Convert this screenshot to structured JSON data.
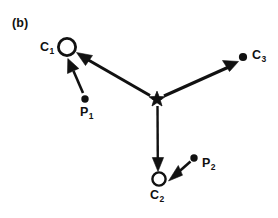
{
  "figure": {
    "panel_label": "(b)",
    "background_color": "#ffffff",
    "stroke_color": "#111111",
    "width": 278,
    "height": 218
  },
  "nodes": {
    "c1": {
      "label_main": "C",
      "label_sub": "1",
      "marker": "open-circle",
      "x": 67,
      "y": 47,
      "radius": 9,
      "label_x": 40,
      "label_y": 41
    },
    "c2": {
      "label_main": "C",
      "label_sub": "2",
      "marker": "open-circle",
      "x": 159,
      "y": 179,
      "radius": 7,
      "label_x": 150,
      "label_y": 189
    },
    "c3": {
      "label_main": "C",
      "label_sub": "3",
      "marker": "filled-dot",
      "x": 243,
      "y": 57,
      "radius": 4,
      "label_x": 252,
      "label_y": 49
    },
    "p1": {
      "label_main": "P",
      "label_sub": "1",
      "marker": "filled-dot",
      "x": 85,
      "y": 99,
      "radius": 3.6,
      "label_x": 80,
      "label_y": 106
    },
    "p2": {
      "label_main": "P",
      "label_sub": "2",
      "marker": "filled-dot",
      "x": 194,
      "y": 158,
      "radius": 3.6,
      "label_x": 202,
      "label_y": 157
    },
    "center": {
      "marker": "star",
      "x": 157,
      "y": 99,
      "radius": 7.5
    }
  },
  "arrows": [
    {
      "name": "center-to-c1",
      "from": "center",
      "to": "c1",
      "x1": 150,
      "y1": 95,
      "x2": 79,
      "y2": 54,
      "thick": true
    },
    {
      "name": "center-to-c3",
      "from": "center",
      "to": "c3",
      "x1": 165,
      "y1": 95,
      "x2": 236,
      "y2": 62,
      "thick": true
    },
    {
      "name": "center-to-c2",
      "from": "center",
      "to": "c2",
      "x1": 157,
      "y1": 107,
      "x2": 158,
      "y2": 170,
      "thick": true
    },
    {
      "name": "p1-to-c1",
      "from": "p1",
      "to": "c1",
      "x1": 83,
      "y1": 93,
      "x2": 68,
      "y2": 59,
      "thick": false
    },
    {
      "name": "p2-to-c2",
      "from": "p2",
      "to": "c2",
      "x1": 190,
      "y1": 162,
      "x2": 169,
      "y2": 181,
      "thick": false
    }
  ]
}
